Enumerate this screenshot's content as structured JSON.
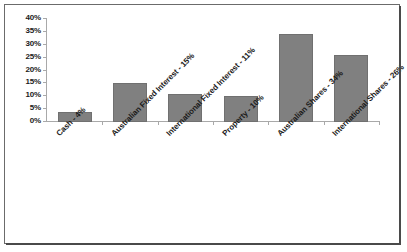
{
  "chart_data": {
    "type": "bar",
    "title": "",
    "subtitle": "",
    "xlabel": "",
    "ylabel": "",
    "categories": [
      "Cash - 4%",
      "Australian Fixed Interest - 15%",
      "International Fixed Interest - 11%",
      "Property - 10%",
      "Australian Shares - 34%",
      "International Shares - 26%"
    ],
    "values": [
      4,
      15,
      11,
      10,
      34,
      26
    ],
    "value_unit": "%",
    "ylim": [
      0,
      40
    ],
    "ytick_labels": [
      "40%",
      "35%",
      "30%",
      "25%",
      "20%",
      "15%",
      "10%",
      "5%",
      "0%"
    ],
    "ytick_values": [
      40,
      35,
      30,
      25,
      20,
      15,
      10,
      5,
      0
    ],
    "ytick_step": 5,
    "grid": false,
    "legend": false,
    "legend_position": "none",
    "bar_color": "#808080",
    "bar_border_color": "#707070",
    "axis_color": "#a9a9a9",
    "text_color": "#1a1a1a",
    "background_color": "#ffffff",
    "frame_color": "#6b6b6b"
  }
}
